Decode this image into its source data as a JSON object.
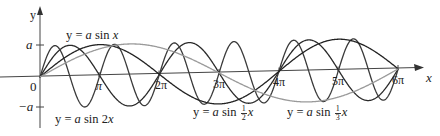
{
  "chart_data": {
    "type": "line",
    "title": "",
    "xlabel": "x",
    "ylabel": "y",
    "x_ticks": [
      "π",
      "2π",
      "3π",
      "4π",
      "5π",
      "6π"
    ],
    "y_ticks": [
      "a",
      "0",
      "−a"
    ],
    "origin_label": "0",
    "xlim": [
      0,
      "6π"
    ],
    "ylim": [
      "−a",
      "a"
    ],
    "grid": false,
    "series": [
      {
        "name": "y = a sin x",
        "function": "a*sin(x)",
        "period": "2π",
        "color": "#2a2a2a"
      },
      {
        "name": "y = a sin 2x",
        "function": "a*sin(2x)",
        "period": "π",
        "color": "#3a3a3a"
      },
      {
        "name": "y = a sin ½x",
        "function": "a*sin(x/2)",
        "period": "4π",
        "color": "#222222"
      },
      {
        "name": "y = a sin ⅓x",
        "function": "a*sin(x/3)",
        "period": "6π",
        "color": "#9a9a9a"
      }
    ]
  },
  "labels": {
    "y_axis": "y",
    "x_axis": "x",
    "a": "a",
    "neg_a": "−a",
    "origin": "0",
    "pi": "π",
    "two_pi": "2π",
    "three_pi": "3π",
    "four_pi": "4π",
    "five_pi": "5π",
    "six_pi": "6π",
    "eq_sin_x_prefix": "y = ",
    "eq_sin_x_a": "a",
    "eq_sin_x_rest": " sin ",
    "eq_sin_x_var": "x",
    "eq_sin_2x_prefix": "y = ",
    "eq_sin_2x_a": "a",
    "eq_sin_2x_rest": " sin 2",
    "eq_sin_2x_var": "x",
    "eq_half_prefix": "y = ",
    "eq_half_a": "a",
    "eq_half_rest": " sin ",
    "eq_half_num": "1",
    "eq_half_den": "2",
    "eq_half_var": "x",
    "eq_third_prefix": "y = ",
    "eq_third_a": "a",
    "eq_third_rest": " sin ",
    "eq_third_num": "1",
    "eq_third_den": "3",
    "eq_third_var": "x"
  }
}
